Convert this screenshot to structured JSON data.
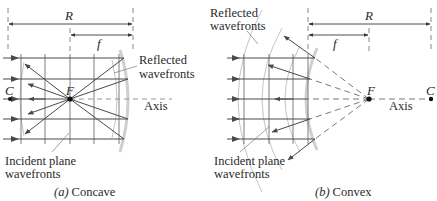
{
  "panels": [
    {
      "id": "concave",
      "caption_letter": "(a)",
      "caption_text": "Concave",
      "labels": {
        "R": "R",
        "f": "f",
        "F": "F",
        "C": "C",
        "reflected": [
          "Reflected",
          "wavefronts"
        ],
        "axis": "Axis",
        "incident": [
          "Incident plane",
          "wavefronts"
        ]
      }
    },
    {
      "id": "convex",
      "caption_letter": "(b)",
      "caption_text": "Convex",
      "labels": {
        "R": "R",
        "f": "f",
        "F": "F",
        "C": "C",
        "reflected": [
          "Reflected",
          "wavefronts"
        ],
        "axis": "Axis",
        "incident": [
          "Incident plane",
          "wavefronts"
        ]
      }
    }
  ],
  "colors": {
    "ray": "#4a4a4a",
    "mirror": "#c8c8c8",
    "wavefront": "#b5b5b5",
    "dim": "#6a6a6a",
    "text": "#2a2a2a"
  }
}
